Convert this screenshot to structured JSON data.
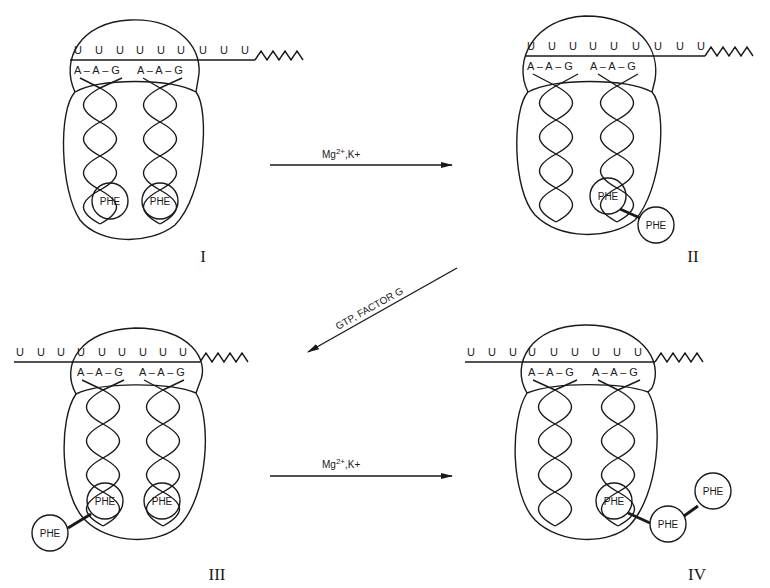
{
  "figure": {
    "panels": [
      {
        "id": "I",
        "label": "I",
        "codons": [
          "U",
          "U",
          "U",
          "U",
          "U",
          "U",
          "U",
          "U",
          "U"
        ],
        "anticodons": [
          "A – A – G",
          "A – A – G"
        ],
        "phe_count": 2
      },
      {
        "id": "II",
        "label": "II",
        "codons": [
          "U",
          "U",
          "U",
          "U",
          "U",
          "U",
          "U",
          "U",
          "U"
        ],
        "anticodons": [
          "A – A – G",
          "A – A – G"
        ],
        "phe_count": 2
      },
      {
        "id": "III",
        "label": "III",
        "codons": [
          "U",
          "U",
          "U",
          "U",
          "U",
          "U",
          "U",
          "U",
          "U"
        ],
        "anticodons": [
          "A – A – G",
          "A – A – G"
        ],
        "phe_count": 3
      },
      {
        "id": "IV",
        "label": "IV",
        "codons": [
          "U",
          "U",
          "U",
          "U",
          "U",
          "U",
          "U",
          "U",
          "U"
        ],
        "anticodons": [
          "A – A – G",
          "A – A – G"
        ],
        "phe_count": 3
      }
    ],
    "phe_label": "PHE",
    "arrows": [
      {
        "from": "I",
        "to": "II",
        "label_main": "Mg",
        "label_sup": "2+",
        "label_rest": ",K+"
      },
      {
        "from": "II",
        "to": "III",
        "label": "GTP, FACTOR G"
      },
      {
        "from": "III",
        "to": "IV",
        "label_main": "Mg",
        "label_sup": "2+",
        "label_rest": ",K+"
      }
    ]
  }
}
